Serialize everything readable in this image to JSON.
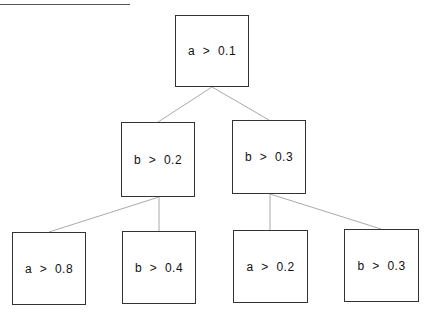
{
  "diagram": {
    "type": "decision-tree",
    "nodes": [
      {
        "id": "root",
        "label": "a  >  0.1",
        "level": 0,
        "x": 175,
        "y": 15,
        "w": 74,
        "h": 72
      },
      {
        "id": "l1",
        "label": "b  >  0.2",
        "level": 1,
        "x": 121,
        "y": 122,
        "w": 74,
        "h": 75
      },
      {
        "id": "r1",
        "label": "b  >  0.3",
        "level": 1,
        "x": 232,
        "y": 120,
        "w": 74,
        "h": 74
      },
      {
        "id": "ll2",
        "label": "a  >  0.8",
        "level": 2,
        "x": 12,
        "y": 232,
        "w": 74,
        "h": 73
      },
      {
        "id": "lr2",
        "label": "b  >  0.4",
        "level": 2,
        "x": 122,
        "y": 231,
        "w": 74,
        "h": 73
      },
      {
        "id": "rl2",
        "label": "a  >  0.2",
        "level": 2,
        "x": 233,
        "y": 230,
        "w": 75,
        "h": 73
      },
      {
        "id": "rr2",
        "label": "b  >  0.3",
        "level": 2,
        "x": 344,
        "y": 229,
        "w": 75,
        "h": 73
      }
    ],
    "edges": [
      {
        "from": "root",
        "to": "l1"
      },
      {
        "from": "root",
        "to": "r1"
      },
      {
        "from": "l1",
        "to": "ll2"
      },
      {
        "from": "l1",
        "to": "lr2"
      },
      {
        "from": "r1",
        "to": "rl2"
      },
      {
        "from": "r1",
        "to": "rr2"
      }
    ],
    "colors": {
      "border": "#333333",
      "edge": "#aaaaaa",
      "text": "#111111"
    }
  }
}
